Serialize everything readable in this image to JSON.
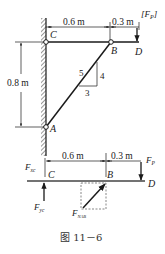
{
  "figure": {
    "caption": "图 11－6",
    "colors": {
      "ink": "#1a1a1a",
      "background": "#ffffff",
      "dashed_box": "#555555"
    }
  },
  "structure": {
    "points": {
      "C": "C",
      "B": "B",
      "D": "D",
      "A": "A"
    },
    "dimensions": {
      "cb": "0.6 m",
      "bd": "0.3 m",
      "ca": "0.8 m"
    },
    "load_label": "[F",
    "load_sub": "P",
    "load_close": "]",
    "slope": {
      "hyp": "5",
      "rise": "4",
      "run": "3"
    }
  },
  "fbd": {
    "points": {
      "C": "C",
      "B": "B",
      "D": "D"
    },
    "dimensions": {
      "cb": "0.6 m",
      "bd": "0.3 m"
    },
    "forces": {
      "fxc": "F",
      "fxc_sub": "xc",
      "fyc": "F",
      "fyc_sub": "yc",
      "fp": "F",
      "fp_sub": "P",
      "fnab": "F",
      "fnab_sub": "NAB"
    }
  }
}
